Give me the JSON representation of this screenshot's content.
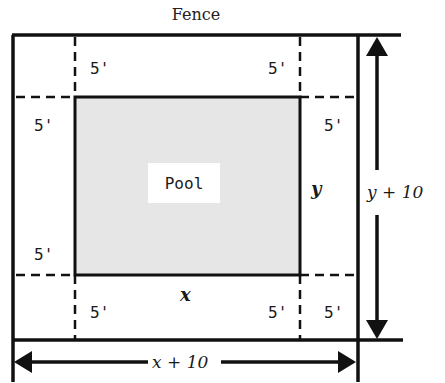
{
  "diagram": {
    "title": "Fence",
    "pool_label": "Pool",
    "pool_fill": "#e6e6e6",
    "line_color": "#111111",
    "offset_labels": {
      "top_left": "5'",
      "top_right": "5'",
      "left_top": "5'",
      "right_top": "5'",
      "left_bottom": "5'",
      "bottom_left": "5'",
      "bottom_right_inner": "5'",
      "bottom_right_outer": "5'"
    },
    "pool_width_label": "x",
    "pool_height_label": "y",
    "total_width_label": "x + 10",
    "total_height_label": "y + 10"
  }
}
